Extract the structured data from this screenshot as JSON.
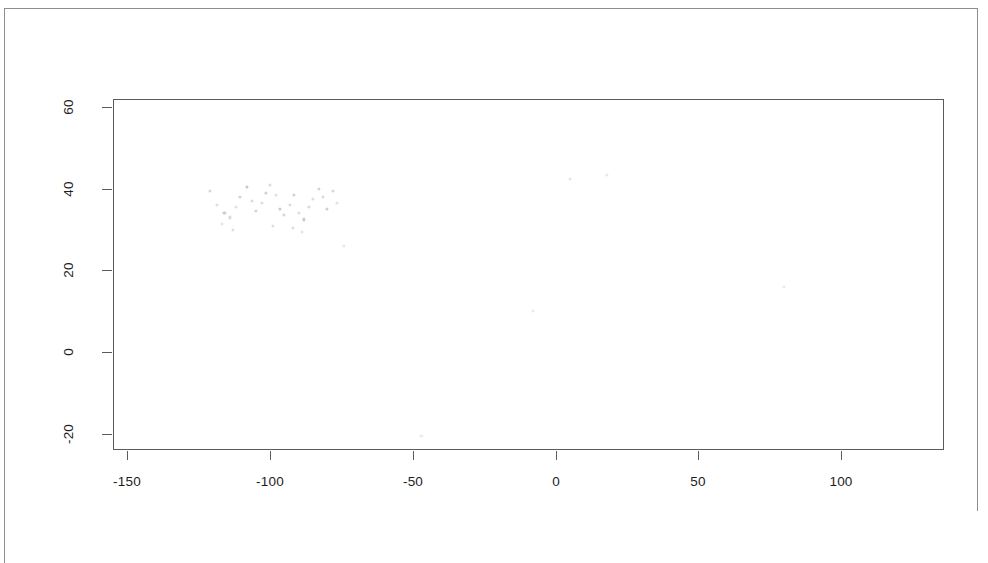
{
  "page": {
    "background_color": "#ffffff",
    "border_color": "#8d8d8d",
    "width": 988,
    "height": 563
  },
  "chart_data": {
    "type": "scatter",
    "title": "",
    "subtitle": "",
    "xlabel": "",
    "ylabel": "",
    "legend": [],
    "legend_position": "none",
    "grid": false,
    "frame": true,
    "axis_color": "#5b5b5b",
    "point_color": "#000000",
    "note": "Scanned page; data points are extremely faint / nearly washed out in the reproduction.",
    "xlim": [
      -155,
      136
    ],
    "ylim": [
      -24,
      62
    ],
    "xticks": [
      -150,
      -100,
      -50,
      0,
      50,
      100
    ],
    "xticklabels": [
      "-150",
      "-100",
      "-50",
      "0",
      "50",
      "100"
    ],
    "yticks": [
      60,
      40,
      20,
      0,
      -20
    ],
    "yticklabels": [
      "60",
      "40",
      "20",
      "0",
      "-20"
    ],
    "points": [
      {
        "x": -121.0,
        "y": 39.5,
        "o": 0.16
      },
      {
        "x": -118.5,
        "y": 36.0,
        "o": 0.13
      },
      {
        "x": -116.0,
        "y": 34.0,
        "o": 0.2
      },
      {
        "x": -114.0,
        "y": 33.0,
        "o": 0.15
      },
      {
        "x": -112.0,
        "y": 35.5,
        "o": 0.12
      },
      {
        "x": -110.5,
        "y": 38.0,
        "o": 0.18
      },
      {
        "x": -108.0,
        "y": 40.5,
        "o": 0.22
      },
      {
        "x": -106.5,
        "y": 37.0,
        "o": 0.14
      },
      {
        "x": -105.0,
        "y": 34.5,
        "o": 0.17
      },
      {
        "x": -103.0,
        "y": 36.5,
        "o": 0.13
      },
      {
        "x": -101.5,
        "y": 39.0,
        "o": 0.19
      },
      {
        "x": -100.0,
        "y": 41.0,
        "o": 0.15
      },
      {
        "x": -98.0,
        "y": 38.5,
        "o": 0.12
      },
      {
        "x": -96.5,
        "y": 35.0,
        "o": 0.21
      },
      {
        "x": -95.0,
        "y": 33.5,
        "o": 0.16
      },
      {
        "x": -93.0,
        "y": 36.0,
        "o": 0.14
      },
      {
        "x": -91.5,
        "y": 38.5,
        "o": 0.18
      },
      {
        "x": -90.0,
        "y": 34.0,
        "o": 0.13
      },
      {
        "x": -88.0,
        "y": 32.5,
        "o": 0.2
      },
      {
        "x": -86.5,
        "y": 35.5,
        "o": 0.15
      },
      {
        "x": -85.0,
        "y": 37.5,
        "o": 0.12
      },
      {
        "x": -83.0,
        "y": 40.0,
        "o": 0.17
      },
      {
        "x": -81.5,
        "y": 38.0,
        "o": 0.14
      },
      {
        "x": -80.0,
        "y": 35.0,
        "o": 0.19
      },
      {
        "x": -78.0,
        "y": 39.5,
        "o": 0.16
      },
      {
        "x": -76.5,
        "y": 36.5,
        "o": 0.11
      },
      {
        "x": -92.0,
        "y": 30.5,
        "o": 0.13
      },
      {
        "x": -89.0,
        "y": 29.5,
        "o": 0.11
      },
      {
        "x": -113.0,
        "y": 30.0,
        "o": 0.12
      },
      {
        "x": -117.0,
        "y": 31.5,
        "o": 0.1
      },
      {
        "x": -99.0,
        "y": 31.0,
        "o": 0.12
      },
      {
        "x": 5.0,
        "y": 42.5,
        "o": 0.1
      },
      {
        "x": 18.0,
        "y": 43.5,
        "o": 0.09
      },
      {
        "x": 80.0,
        "y": 16.0,
        "o": 0.09
      },
      {
        "x": -8.0,
        "y": 10.0,
        "o": 0.08
      },
      {
        "x": -47.0,
        "y": -20.5,
        "o": 0.08
      },
      {
        "x": -74.0,
        "y": 26.0,
        "o": 0.09
      }
    ]
  }
}
